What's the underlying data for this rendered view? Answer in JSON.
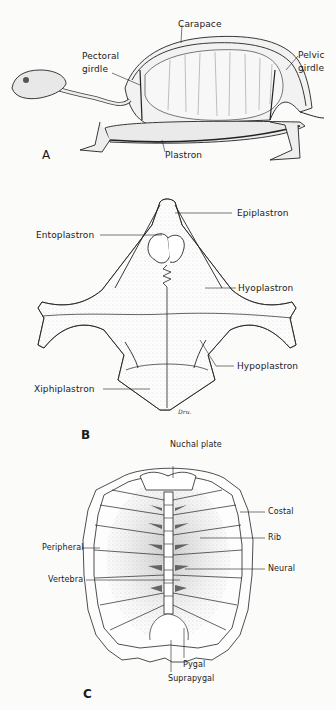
{
  "figure": {
    "panels": {
      "a": {
        "letter": "A",
        "view": "lateral skeleton",
        "labels": {
          "carapace": "Carapace",
          "pectoral_girdle_1": "Pectoral",
          "pectoral_girdle_2": "girdle",
          "pelvic_girdle_1": "Pelvic",
          "pelvic_girdle_2": "girdle",
          "plastron": "Plastron"
        }
      },
      "b": {
        "letter": "B",
        "view": "plastron (ventral)",
        "labels": {
          "epiplastron": "Epiplastron",
          "entoplastron": "Entoplastron",
          "hyoplastron": "Hyoplastron",
          "hypoplastron": "Hypoplastron",
          "xiphiplastron": "Xiphiplastron"
        },
        "signature": "Dru."
      },
      "c": {
        "letter": "C",
        "view": "carapace (dorsal, inner)",
        "labels": {
          "nuchal_plate": "Nuchal plate",
          "costal": "Costal",
          "rib": "Rib",
          "peripheral": "Peripheral",
          "neural": "Neural",
          "vertebra": "Vertebra",
          "pygal": "Pygal",
          "suprapygal": "Suprapygal"
        }
      }
    }
  }
}
